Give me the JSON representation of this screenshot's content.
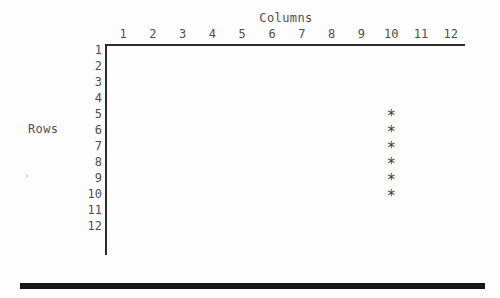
{
  "figure": {
    "columns_axis_title": "Columns",
    "rows_axis_title": "Rows",
    "column_labels": [
      "1",
      "2",
      "3",
      "4",
      "5",
      "6",
      "7",
      "8",
      "9",
      "10",
      "11",
      "12"
    ],
    "row_labels": [
      "1",
      "2",
      "3",
      "4",
      "5",
      "6",
      "7",
      "8",
      "9",
      "10",
      "11",
      "12"
    ],
    "marker_glyph": "*",
    "axis_color": "#2b2b2b",
    "text_color": "#4f4f4f",
    "marker_color": "#3a3a3a",
    "rule_color": "#17171a",
    "background_color": "#fdfdfd"
  },
  "chart_data": {
    "type": "scatter",
    "title": "",
    "xlabel": "Columns",
    "ylabel": "Rows",
    "x_tick_labels": [
      "1",
      "2",
      "3",
      "4",
      "5",
      "6",
      "7",
      "8",
      "9",
      "10",
      "11",
      "12"
    ],
    "y_tick_labels": [
      "1",
      "2",
      "3",
      "4",
      "5",
      "6",
      "7",
      "8",
      "9",
      "10",
      "11",
      "12"
    ],
    "xlim": [
      1,
      12
    ],
    "ylim": [
      1,
      12
    ],
    "y_axis_inverted": true,
    "grid": false,
    "legend": null,
    "marker": "*",
    "points": [
      {
        "column": 10,
        "row": 5
      },
      {
        "column": 10,
        "row": 6
      },
      {
        "column": 10,
        "row": 7
      },
      {
        "column": 10,
        "row": 8
      },
      {
        "column": 10,
        "row": 9
      },
      {
        "column": 10,
        "row": 10
      }
    ],
    "x": [
      10,
      10,
      10,
      10,
      10,
      10
    ],
    "y": [
      5,
      6,
      7,
      8,
      9,
      10
    ]
  }
}
